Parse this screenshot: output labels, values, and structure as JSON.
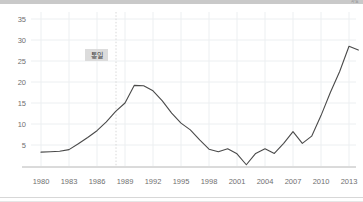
{
  "top_bar": {
    "partial_label": "자료"
  },
  "chart_data": {
    "type": "line",
    "title": "",
    "subtitle": "",
    "xlabel": "",
    "ylabel": "",
    "xlim": [
      1980,
      2014
    ],
    "ylim": [
      0,
      36
    ],
    "yticks": [
      5,
      10,
      15,
      20,
      25,
      30,
      35
    ],
    "xticks": [
      1980,
      1983,
      1986,
      1989,
      1992,
      1995,
      1998,
      2001,
      2004,
      2007,
      2010,
      2013
    ],
    "grid": true,
    "legend": null,
    "annotations": [
      {
        "name": "unification-marker",
        "text": "통일",
        "x": 1990,
        "y": 26.5,
        "line": "vertical-dotted"
      }
    ],
    "series": [
      {
        "name": "series-1",
        "color": "#4a4a4a",
        "x": [
          1980,
          1981,
          1982,
          1983,
          1984,
          1985,
          1986,
          1987,
          1988,
          1989,
          1990,
          1991,
          1992,
          1993,
          1994,
          1995,
          1996,
          1997,
          1998,
          1999,
          2000,
          2001,
          2002,
          2003,
          2004,
          2005,
          2006,
          2007,
          2008,
          2009,
          2010,
          2011,
          2012,
          2013,
          2014
        ],
        "values": [
          3.3,
          3.4,
          3.5,
          3.9,
          5.3,
          6.8,
          8.4,
          10.5,
          13.0,
          15.0,
          19.2,
          19.1,
          17.9,
          15.5,
          12.6,
          10.2,
          8.6,
          6.2,
          4.0,
          3.4,
          4.1,
          2.9,
          0.3,
          3.0,
          4.1,
          3.0,
          5.4,
          8.2,
          5.4,
          7.1,
          12.0,
          17.5,
          22.5,
          28.5,
          27.6
        ]
      }
    ]
  }
}
